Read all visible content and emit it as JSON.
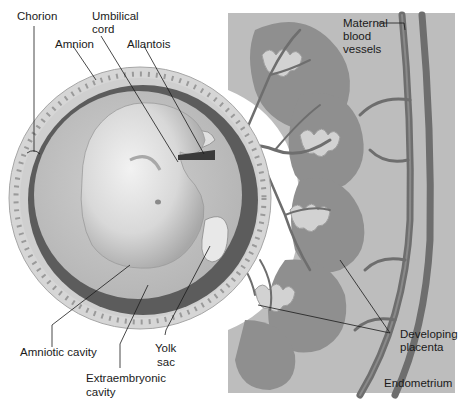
{
  "figure": {
    "colors": {
      "background": "#ffffff",
      "endometrium": "#bdbdbd",
      "placenta_lobes": "#8f8f8f",
      "vessels": "#6e6e6e",
      "chorion_ring": "#d6d6d6",
      "extraembryonic_dark": "#5c5c5c",
      "amniotic_fluid": "#c4c4c4",
      "embryo": "#e2e2e2",
      "label_text": "#1a1a1a"
    }
  },
  "labels": {
    "chorion": "Chorion",
    "umbilical_cord_1": "Umbilical",
    "umbilical_cord_2": "cord",
    "amnion": "Amnion",
    "allantois": "Allantois",
    "maternal_1": "Maternal",
    "maternal_2": "blood",
    "maternal_3": "vessels",
    "amniotic_cavity": "Amniotic cavity",
    "yolk_sac_1": "Yolk",
    "yolk_sac_2": "sac",
    "extraembryonic_1": "Extraembryonic",
    "extraembryonic_2": "cavity",
    "developing_1": "Developing",
    "developing_2": "placenta",
    "endometrium": "Endometrium"
  }
}
